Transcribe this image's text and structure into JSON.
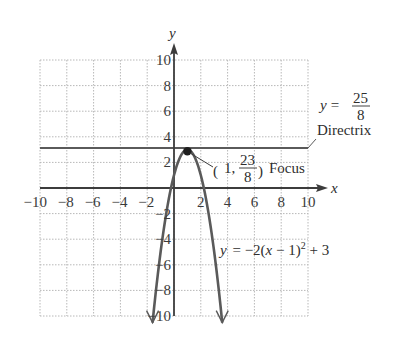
{
  "chart_data": {
    "type": "line",
    "title": "",
    "xlabel": "x",
    "ylabel": "y",
    "xlim": [
      -10,
      10
    ],
    "ylim": [
      -10,
      10
    ],
    "grid": true,
    "grid_step": 2,
    "x_ticks": [
      "−10",
      "−8",
      "−6",
      "−4",
      "−2",
      "2",
      "4",
      "6",
      "8",
      "10"
    ],
    "y_ticks": [
      "10",
      "8",
      "6",
      "4",
      "2",
      "−2",
      "−4",
      "−6",
      "−8",
      "−10"
    ],
    "series": [
      {
        "name": "parabola",
        "equation": "y = −2(x − 1)² + 3",
        "vertex": [
          1,
          3
        ],
        "opens": "down"
      },
      {
        "name": "directrix",
        "equation": "y = 25/8",
        "value": 3.125
      }
    ],
    "points": [
      {
        "label": "Focus",
        "x": 1,
        "y": 2.875,
        "display": "(1, 23/8)"
      }
    ],
    "annotations": {
      "directrix_eq_prefix": "y =",
      "directrix_num": "25",
      "directrix_den": "8",
      "directrix_label": "Directrix",
      "focus_prefix": "1,",
      "focus_num": "23",
      "focus_den": "8",
      "focus_label": "Focus",
      "curve_label_y": "y",
      "curve_label_eq": "= −2(",
      "curve_label_x": "x",
      "curve_label_rest": " − 1)",
      "curve_label_exp": "2",
      "curve_label_tail": " + 3"
    },
    "colors": {
      "axis": "#3c3c3c",
      "grid": "#b8b8b8",
      "curve": "#5a5a5a",
      "directrix": "#5a5a5a",
      "focus_point": "#1e1e1e"
    }
  }
}
